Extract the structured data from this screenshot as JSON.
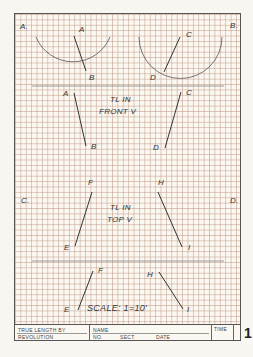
{
  "sheet": {
    "quadrant_labels": {
      "a": "A.",
      "b": "B.",
      "c": "C.",
      "d": "D."
    },
    "problem_a": {
      "point_1": "A",
      "point_2": "B"
    },
    "problem_b": {
      "point_1": "C",
      "point_2": "D"
    },
    "front_view": {
      "label_a_top": "A",
      "label_a_bottom": "B",
      "label_c_top": "C",
      "label_c_bottom": "D",
      "note_line1": "TL  IN",
      "note_line2": "FRONT  V"
    },
    "top_view": {
      "label_f": "F",
      "label_e": "E",
      "label_h": "H",
      "label_i": "I",
      "note_line1": "TL  IN",
      "note_line2": "TOP  V"
    },
    "bottom_view": {
      "label_f": "F",
      "label_e": "E",
      "label_h": "H",
      "label_i": "I",
      "scale": "SCALE:  1=10'"
    },
    "colors": {
      "grid": "#be9682",
      "line": "#333333",
      "paper": "#fbf8f2"
    }
  },
  "title_block": {
    "title_line1": "TRUE  LENGTH  BY",
    "title_line2": "REVOLUTION",
    "name_label": "NAME",
    "no_label": "NO.",
    "sect_label": "SECT",
    "date_label": "DATE",
    "time_label": "TIME",
    "sheet_number": "1"
  }
}
